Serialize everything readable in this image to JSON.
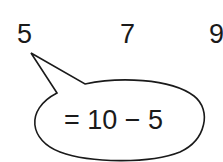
{
  "sequence": {
    "numbers": [
      "5",
      "7",
      "9"
    ]
  },
  "callout": {
    "target_index": 0,
    "text": "= 10 − 5",
    "shape": "speech-bubble-ellipse",
    "stroke_color": "#1a1a1a",
    "fill_color": "#ffffff"
  }
}
